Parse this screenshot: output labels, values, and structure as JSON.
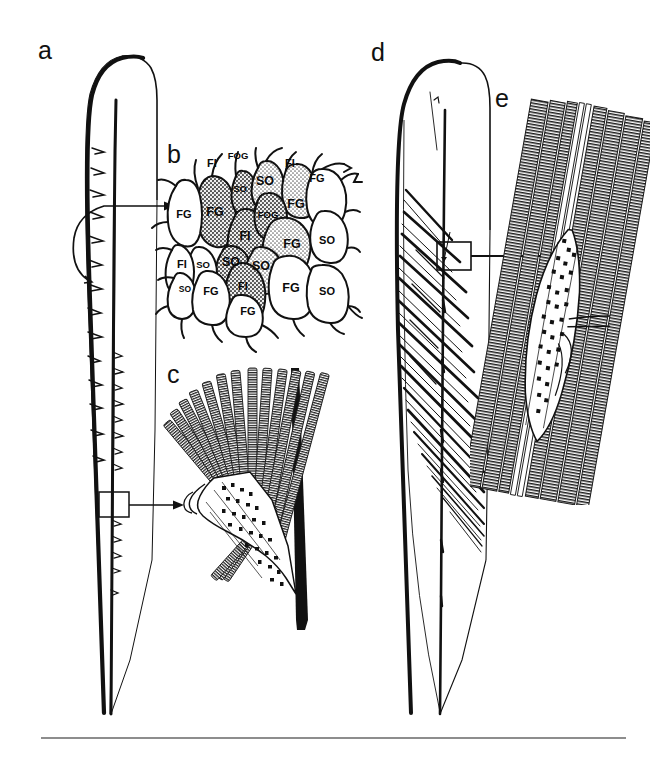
{
  "figure": {
    "width": 663,
    "height": 757,
    "background_color": "#ffffff",
    "ink_color": "#111111",
    "rule_color": "#8d8d8d",
    "panel_letters": [
      {
        "id": "a",
        "label": "a",
        "x": 38,
        "y": 38
      },
      {
        "id": "b",
        "label": "b",
        "x": 167,
        "y": 142
      },
      {
        "id": "c",
        "label": "c",
        "x": 167,
        "y": 362
      },
      {
        "id": "d",
        "label": "d",
        "x": 371,
        "y": 40
      },
      {
        "id": "e",
        "label": "e",
        "x": 495,
        "y": 86
      }
    ]
  },
  "panels": {
    "a": {
      "letter": "a",
      "description": "Whole elongate blade-shaped structure, left margin thickened and bearing small barbs; callout box on lower axis leads to panel c; curved arrow from upper barb leads to panel b"
    },
    "b": {
      "letter": "b",
      "description": "Surface mosaic of polygonal cells, central cells stippled/shaded, each cell annotated with a two- or three-letter cell-type code",
      "cell_labels": [
        {
          "text": "FI",
          "x": 212,
          "y": 163,
          "size": "sz-md"
        },
        {
          "text": "FOG",
          "x": 238,
          "y": 156,
          "size": "sz-sm"
        },
        {
          "text": "FI",
          "x": 290,
          "y": 163,
          "size": "sz-md"
        },
        {
          "text": "SO",
          "x": 240,
          "y": 189,
          "size": "sz-sm"
        },
        {
          "text": "SO",
          "x": 265,
          "y": 181,
          "size": "sz-lg"
        },
        {
          "text": "FG",
          "x": 317,
          "y": 178,
          "size": "sz-md"
        },
        {
          "text": "FG",
          "x": 215,
          "y": 212,
          "size": "sz-lg"
        },
        {
          "text": "FOG",
          "x": 268,
          "y": 215,
          "size": "sz-sm"
        },
        {
          "text": "FG",
          "x": 296,
          "y": 204,
          "size": "sz-lg"
        },
        {
          "text": "FG",
          "x": 184,
          "y": 214,
          "size": "sz-md"
        },
        {
          "text": "FI",
          "x": 245,
          "y": 236,
          "size": "sz-lg"
        },
        {
          "text": "FG",
          "x": 292,
          "y": 244,
          "size": "sz-lg"
        },
        {
          "text": "SO",
          "x": 327,
          "y": 240,
          "size": "sz-md"
        },
        {
          "text": "FI",
          "x": 182,
          "y": 264,
          "size": "sz-md"
        },
        {
          "text": "SO",
          "x": 203,
          "y": 265,
          "size": "sz-sm"
        },
        {
          "text": "SO",
          "x": 231,
          "y": 262,
          "size": "sz-lg"
        },
        {
          "text": "SO",
          "x": 261,
          "y": 266,
          "size": "sz-lg"
        },
        {
          "text": "SO",
          "x": 185,
          "y": 289,
          "size": "sz-xs"
        },
        {
          "text": "FG",
          "x": 211,
          "y": 291,
          "size": "sz-md"
        },
        {
          "text": "FI",
          "x": 243,
          "y": 286,
          "size": "sz-md"
        },
        {
          "text": "FG",
          "x": 291,
          "y": 288,
          "size": "sz-lg"
        },
        {
          "text": "SO",
          "x": 327,
          "y": 291,
          "size": "sz-md"
        },
        {
          "text": "FG",
          "x": 248,
          "y": 311,
          "size": "sz-md"
        }
      ],
      "legend_codes": [
        "FG",
        "FI",
        "SO",
        "FOG"
      ]
    },
    "c": {
      "letter": "c",
      "description": "Detail of a barb: fan of transversely striated filament bundles radiating from a cellular base, bordered on the right by a solid black axial rod"
    },
    "d": {
      "letter": "d",
      "description": "Whole blade-shaped structure of second species, interior filled with oblique fibre tracts; callout box on the axis leads to panel e"
    },
    "e": {
      "letter": "e",
      "description": "Detail of an oblique fibre tract: parallel transversely striated bundles enclosing an elongate cellular inclusion with branching processes"
    }
  }
}
